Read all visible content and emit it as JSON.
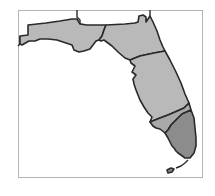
{
  "map": {
    "title": "Florida regions",
    "colors": {
      "background": "#ffffff",
      "frame": "#b4b4b4",
      "border": "#2a2a2a",
      "region_light": "#b9b9b9",
      "region_mid": "#a9a9a9",
      "region_dark": "#8c8c8c"
    },
    "regions": [
      {
        "id": "panhandle",
        "shade": "light"
      },
      {
        "id": "north",
        "shade": "light"
      },
      {
        "id": "central",
        "shade": "light"
      },
      {
        "id": "south-west-strip",
        "shade": "mid"
      },
      {
        "id": "southeast",
        "shade": "dark"
      },
      {
        "id": "keys",
        "shade": "dark"
      }
    ]
  }
}
